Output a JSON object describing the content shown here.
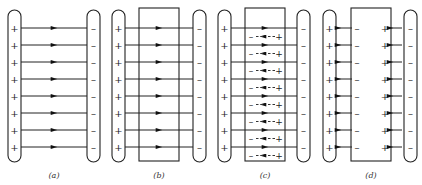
{
  "figure": {
    "panels": [
      {
        "id": "a",
        "label": "(a)",
        "has_slab": false,
        "field_through_slab": true,
        "induced_charges": "none"
      },
      {
        "id": "b",
        "label": "(b)",
        "has_slab": true,
        "field_through_slab": true,
        "induced_charges": "none"
      },
      {
        "id": "c",
        "label": "(c)",
        "has_slab": true,
        "field_through_slab": true,
        "induced_charges": "dipoles"
      },
      {
        "id": "d",
        "label": "(d)",
        "has_slab": true,
        "field_through_slab": false,
        "induced_charges": "surface"
      }
    ],
    "signs": {
      "positive": "+",
      "negative": "–"
    },
    "rows": 8,
    "colors": {
      "stroke": "#222222",
      "background": "#ffffff"
    }
  }
}
